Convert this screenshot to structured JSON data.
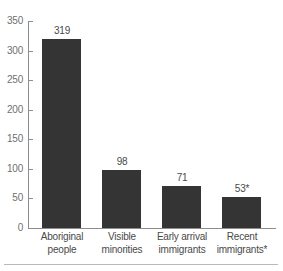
{
  "chart_data": {
    "type": "bar",
    "title": "",
    "subtitle": "",
    "xlabel": "",
    "ylabel": "",
    "ylim": [
      0,
      350
    ],
    "ytick_step": 50,
    "grid": false,
    "legend": false,
    "legend_position": "none",
    "orientation": "vertical",
    "categories": [
      "Aboriginal people",
      "Visible minorities",
      "Early arrival immigrants",
      "Recent immigrants*"
    ],
    "category_lines": [
      [
        "Aboriginal",
        "people"
      ],
      [
        "Visible",
        "minorities"
      ],
      [
        "Early arrival",
        "immigrants"
      ],
      [
        "Recent",
        "immigrants*"
      ]
    ],
    "values": [
      319,
      98,
      71,
      53
    ],
    "value_labels": [
      "319",
      "98",
      "71",
      "53*"
    ],
    "ytick_labels": [
      "0",
      "50",
      "100",
      "150",
      "200",
      "250",
      "300",
      "350"
    ],
    "ytick_values": [
      0,
      50,
      100,
      150,
      200,
      250,
      300,
      350
    ],
    "annotations": [
      "*"
    ],
    "colors": {
      "bar_fill": "#343434",
      "axis": "#8d8d8d",
      "tick_text": "#6f6f6f",
      "label_text": "#4a4a4a",
      "rule": "#b9b9b9",
      "background": "#ffffff"
    }
  }
}
